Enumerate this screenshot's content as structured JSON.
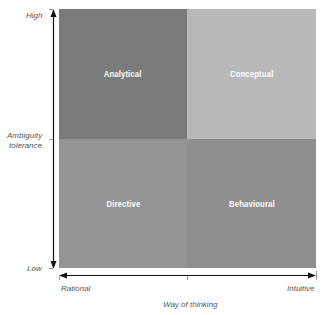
{
  "diagram": {
    "type": "2x2 matrix",
    "quadrants": [
      {
        "position": "top-left",
        "label": "Analytical",
        "color": "#7a7a7a"
      },
      {
        "position": "top-right",
        "label": "Conceptual",
        "color": "#b9b9b9"
      },
      {
        "position": "bottom-left",
        "label": "Directive",
        "color": "#959595"
      },
      {
        "position": "bottom-right",
        "label": "Behavioural",
        "color": "#8f8f8f"
      }
    ],
    "y_axis": {
      "title_line1": "Ambiguity",
      "title_line2": "tolerance",
      "high": "High",
      "low": "Low"
    },
    "x_axis": {
      "title": "Way of thinking",
      "left": "Rational",
      "right": "Intuitive"
    }
  }
}
